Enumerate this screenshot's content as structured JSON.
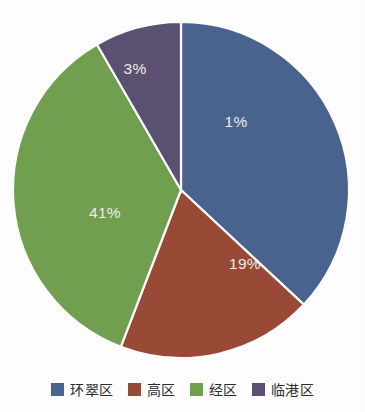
{
  "chart_data": {
    "type": "pie",
    "title": "",
    "subtitle": "",
    "xlabel": "",
    "ylabel": "",
    "legend_position": "bottom",
    "grid": false,
    "background_color": "#ffffff",
    "label_text_color": "#f0eee8",
    "separator_color": "#ffffff",
    "start_angle_deg": 0,
    "direction": "clockwise",
    "categories": [
      "环翠区",
      "高区",
      "经区",
      "临港区"
    ],
    "data_labels": [
      "1%",
      "19%",
      "41%",
      "3%"
    ],
    "values": [
      37,
      19,
      41,
      3
    ],
    "colors": [
      "#4a6490",
      "#9a4a37",
      "#72a050",
      "#5b5273"
    ],
    "slices": [
      {
        "name": "环翠区",
        "label": "1%",
        "value": 37,
        "color": "#4a6490",
        "sweep_deg": 133,
        "label_x": 236,
        "label_y": 123
      },
      {
        "name": "高区",
        "label": "19%",
        "value": 19,
        "color": "#9a4a37",
        "sweep_deg": 68,
        "label_x": 245,
        "label_y": 265
      },
      {
        "name": "经区",
        "label": "41%",
        "value": 41,
        "color": "#72a050",
        "sweep_deg": 129,
        "label_x": 105,
        "label_y": 214
      },
      {
        "name": "临港区",
        "label": "3%",
        "value": 3,
        "color": "#5b5273",
        "sweep_deg": 30,
        "label_x": 135,
        "label_y": 70
      }
    ],
    "geometry": {
      "center_x": 181,
      "center_y": 190,
      "radius": 168
    }
  },
  "legend": {
    "items": [
      {
        "label": "环翠区",
        "color": "#4a6490"
      },
      {
        "label": "高区",
        "color": "#9a4a37"
      },
      {
        "label": "经区",
        "color": "#72a050"
      },
      {
        "label": "临港区",
        "color": "#5b5273"
      }
    ]
  }
}
